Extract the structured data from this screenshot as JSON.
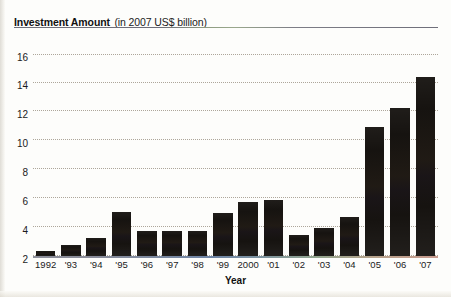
{
  "chart_data": {
    "type": "bar",
    "title": "Investment Amount",
    "subtitle": "(in 2007 US$ billion)",
    "xlabel": "Year",
    "ylabel": "Investment Amount (in 2007 US$ billion)",
    "categories": [
      "1992",
      "'93",
      "'94",
      "'95",
      "'96",
      "'97",
      "'98",
      "'99",
      "2000",
      "'01",
      "'02",
      "'03",
      "'04",
      "'05",
      "'06",
      "'07"
    ],
    "values": [
      0.4,
      0.9,
      1.4,
      3.5,
      2.0,
      2.0,
      2.0,
      3.4,
      4.3,
      4.4,
      1.7,
      2.2,
      3.1,
      10.2,
      11.7,
      14.2
    ],
    "ylim": [
      0,
      16
    ],
    "yticks": [
      2,
      4,
      6,
      8,
      10,
      12,
      14,
      16
    ],
    "ytick_labels": [
      "2",
      "4",
      "6",
      "8",
      "10",
      "12",
      "14",
      "16"
    ],
    "grid": true,
    "legend": "none",
    "bar_color": "#161310",
    "grid_color": "#a9a295",
    "rule_color": "#6f6f7a"
  }
}
